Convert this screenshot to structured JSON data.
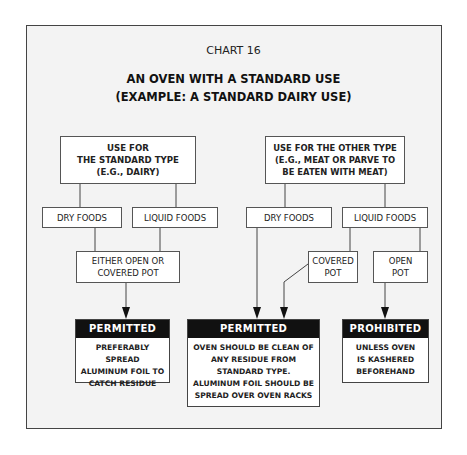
{
  "chart": {
    "caption": "CHART 16",
    "title_line1": "AN OVEN WITH A STANDARD USE",
    "title_line2": "(EXAMPLE: A STANDARD DAIRY USE)"
  },
  "left_branch": {
    "root": [
      "USE FOR",
      "THE STANDARD TYPE",
      "(E.G., DAIRY)"
    ],
    "dry": "DRY FOODS",
    "liquid": "LIQUID FOODS",
    "pot": [
      "EITHER OPEN OR",
      "COVERED POT"
    ],
    "result": {
      "header": "PERMITTED",
      "body": [
        "PREFERABLY SPREAD",
        "ALUMINUM FOIL TO",
        "CATCH RESIDUE"
      ]
    }
  },
  "right_branch": {
    "root": [
      "USE FOR THE OTHER TYPE",
      "(E.G., MEAT OR PARVE TO",
      "BE EATEN WITH MEAT)"
    ],
    "dry": "DRY FOODS",
    "liquid": "LIQUID FOODS",
    "covered_pot": [
      "COVERED",
      "POT"
    ],
    "open_pot": [
      "OPEN",
      "POT"
    ],
    "permitted": {
      "header": "PERMITTED",
      "body": [
        "OVEN SHOULD BE CLEAN OF",
        "ANY RESIDUE FROM",
        "STANDARD TYPE.",
        "ALUMINUM FOIL SHOULD BE",
        "SPREAD OVER OVEN RACKS"
      ]
    },
    "prohibited": {
      "header": "PROHIBITED",
      "body": [
        "UNLESS OVEN",
        "IS KASHERED",
        "BEFOREHAND"
      ]
    }
  },
  "colors": {
    "frame_bg": "#f3f3f3",
    "result_header_bg": "#111111",
    "line": "#444444"
  }
}
